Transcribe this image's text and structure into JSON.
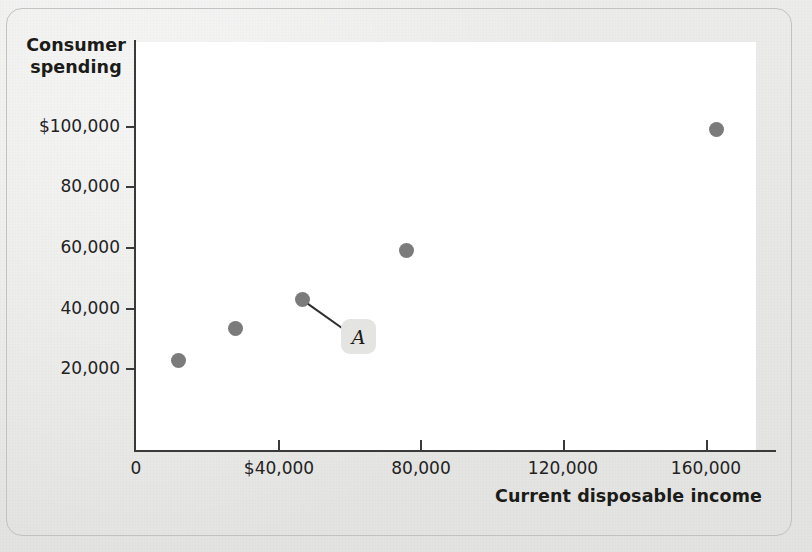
{
  "chart_data": {
    "type": "scatter",
    "title": "",
    "xlabel": "Current disposable income",
    "ylabel": "Consumer spending",
    "xlim": [
      0,
      180000
    ],
    "ylim": [
      0,
      112000
    ],
    "grid": false,
    "legend": null,
    "x_ticks": [
      {
        "value": 0,
        "label": "0"
      },
      {
        "value": 40000,
        "label": "$40,000"
      },
      {
        "value": 80000,
        "label": "80,000"
      },
      {
        "value": 120000,
        "label": "120,000"
      },
      {
        "value": 160000,
        "label": "160,000"
      }
    ],
    "y_ticks": [
      {
        "value": 20000,
        "label": "20,000"
      },
      {
        "value": 40000,
        "label": "40,000"
      },
      {
        "value": 60000,
        "label": "60,000"
      },
      {
        "value": 80000,
        "label": "80,000"
      },
      {
        "value": 100000,
        "label": "$100,000"
      }
    ],
    "points": [
      {
        "x": 12000,
        "y": 22500
      },
      {
        "x": 28000,
        "y": 33000
      },
      {
        "x": 47000,
        "y": 42500
      },
      {
        "x": 76000,
        "y": 59000
      },
      {
        "x": 163000,
        "y": 99000
      }
    ],
    "annotations": [
      {
        "label": "A",
        "target_point_index": 2,
        "note": "callout label pointing to the third data point"
      }
    ],
    "series_color": "#7b7b7b"
  },
  "figure": {
    "background_color": "#e9e9e7",
    "plot_background_color": "#ffffff",
    "axis_color": "#3a3a3a"
  }
}
